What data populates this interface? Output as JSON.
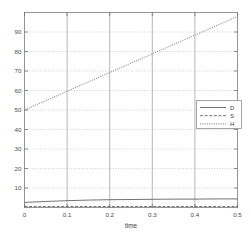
{
  "chart_data": {
    "type": "line",
    "title": "",
    "xlabel": "time",
    "ylabel": "",
    "xlim": [
      0,
      0.5
    ],
    "ylim": [
      0,
      100
    ],
    "grid": true,
    "legend_position": "right",
    "xticks": [
      0,
      0.1,
      0.2,
      0.3,
      0.4,
      0.5
    ],
    "xticklabels": [
      "0",
      "0.1",
      "0.2",
      "0.3",
      "0.4",
      "0.5"
    ],
    "yticks": [
      10,
      20,
      30,
      40,
      50,
      60,
      70,
      80,
      90
    ],
    "yticklabels": [
      "10",
      "20",
      "30",
      "40",
      "50",
      "60",
      "70",
      "80",
      "90"
    ],
    "x": [
      0,
      0.05,
      0.1,
      0.15,
      0.2,
      0.25,
      0.3,
      0.35,
      0.4,
      0.45,
      0.5
    ],
    "series": [
      {
        "name": "D",
        "style": "solid",
        "values": [
          2.6,
          3.1,
          3.5,
          3.8,
          4.0,
          4.1,
          4.2,
          4.3,
          4.3,
          4.4,
          4.4
        ]
      },
      {
        "name": "S",
        "style": "dashed",
        "values": [
          0.5,
          0.5,
          0.5,
          0.5,
          0.5,
          0.5,
          0.5,
          0.5,
          0.5,
          0.5,
          0.5
        ]
      },
      {
        "name": "H",
        "style": "dotted",
        "values": [
          50.0,
          54.8,
          59.6,
          64.4,
          69.2,
          74.0,
          78.8,
          83.6,
          88.4,
          93.2,
          98.0
        ]
      }
    ]
  },
  "legend": {
    "entries": [
      {
        "label": "D"
      },
      {
        "label": "S"
      },
      {
        "label": "H"
      }
    ]
  },
  "axes": {
    "xlabel": "time",
    "xticklabels": [
      "0",
      "0.1",
      "0.2",
      "0.3",
      "0.4",
      "0.5"
    ],
    "yticklabels": [
      "10",
      "20",
      "30",
      "40",
      "50",
      "60",
      "70",
      "80",
      "90"
    ]
  },
  "colors": {
    "line": "#5a5a5a",
    "grid": "#bcbcbc",
    "axis": "#8a8a8a",
    "background": "#ffffff"
  }
}
